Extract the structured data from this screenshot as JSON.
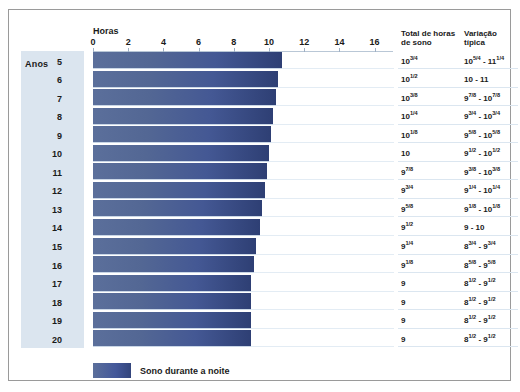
{
  "chart_data": {
    "type": "bar",
    "title": "",
    "xlabel": "Horas",
    "ylabel": "Anos",
    "xlim": [
      0,
      17
    ],
    "grid": true,
    "legend_position": "bottom-left",
    "tick_values": [
      0,
      2,
      4,
      6,
      8,
      10,
      12,
      14,
      16
    ],
    "tick_labels": [
      "0",
      "2",
      "4",
      "6",
      "8",
      "10",
      "12",
      "14",
      "16"
    ],
    "categories": [
      5,
      6,
      7,
      8,
      9,
      10,
      11,
      12,
      13,
      14,
      15,
      16,
      17,
      18,
      19,
      20
    ],
    "category_labels": [
      "5",
      "6",
      "7",
      "8",
      "9",
      "10",
      "11",
      "12",
      "13",
      "14",
      "15",
      "16",
      "17",
      "18",
      "19",
      "20"
    ],
    "values": [
      10.75,
      10.5,
      10.375,
      10.25,
      10.125,
      10,
      9.875,
      9.75,
      9.625,
      9.5,
      9.25,
      9.125,
      9,
      9,
      9,
      9
    ],
    "series": [
      {
        "name": "Sono durante a noite",
        "values": [
          10.75,
          10.5,
          10.375,
          10.25,
          10.125,
          10,
          9.875,
          9.75,
          9.625,
          9.5,
          9.25,
          9.125,
          9,
          9,
          9,
          9
        ]
      }
    ]
  },
  "axis": {
    "title": "Horas",
    "ticks": [
      "0",
      "2",
      "4",
      "6",
      "8",
      "10",
      "12",
      "14",
      "16"
    ]
  },
  "years": {
    "title": "Anos",
    "labels": [
      "5",
      "6",
      "7",
      "8",
      "9",
      "10",
      "11",
      "12",
      "13",
      "14",
      "15",
      "16",
      "17",
      "18",
      "19",
      "20"
    ]
  },
  "columns": {
    "total_header": "Total de horas de sono",
    "variation_header": "Variação típica",
    "total_header_line1": "Total de horas",
    "total_header_line2": "de sono",
    "variation_header_line1": "Variação",
    "variation_header_line2": "típica"
  },
  "rows": [
    {
      "year": "5",
      "total": "10",
      "total_frac": "3/4",
      "variation_from": "10",
      "variation_from_frac": "5/4",
      "variation_to": "11",
      "variation_to_frac": "1/4"
    },
    {
      "year": "6",
      "total": "10",
      "total_frac": "1/2",
      "variation_from": "10",
      "variation_from_frac": "",
      "variation_to": "11",
      "variation_to_frac": ""
    },
    {
      "year": "7",
      "total": "10",
      "total_frac": "3/8",
      "variation_from": "9",
      "variation_from_frac": "7/8",
      "variation_to": "10",
      "variation_to_frac": "7/8"
    },
    {
      "year": "8",
      "total": "10",
      "total_frac": "1/4",
      "variation_from": "9",
      "variation_from_frac": "3/4",
      "variation_to": "10",
      "variation_to_frac": "3/4"
    },
    {
      "year": "9",
      "total": "10",
      "total_frac": "1/8",
      "variation_from": "9",
      "variation_from_frac": "5/8",
      "variation_to": "10",
      "variation_to_frac": "5/8"
    },
    {
      "year": "10",
      "total": "10",
      "total_frac": "",
      "variation_from": "9",
      "variation_from_frac": "1/2",
      "variation_to": "10",
      "variation_to_frac": "1/2"
    },
    {
      "year": "11",
      "total": "9",
      "total_frac": "7/8",
      "variation_from": "9",
      "variation_from_frac": "3/8",
      "variation_to": "10",
      "variation_to_frac": "3/8"
    },
    {
      "year": "12",
      "total": "9",
      "total_frac": "3/4",
      "variation_from": "9",
      "variation_from_frac": "1/4",
      "variation_to": "10",
      "variation_to_frac": "1/4"
    },
    {
      "year": "13",
      "total": "9",
      "total_frac": "5/8",
      "variation_from": "9",
      "variation_from_frac": "1/8",
      "variation_to": "10",
      "variation_to_frac": "1/8"
    },
    {
      "year": "14",
      "total": "9",
      "total_frac": "1/2",
      "variation_from": "9",
      "variation_from_frac": "",
      "variation_to": "10",
      "variation_to_frac": ""
    },
    {
      "year": "15",
      "total": "9",
      "total_frac": "1/4",
      "variation_from": "8",
      "variation_from_frac": "3/4",
      "variation_to": "9",
      "variation_to_frac": "3/4"
    },
    {
      "year": "16",
      "total": "9",
      "total_frac": "1/8",
      "variation_from": "8",
      "variation_from_frac": "5/8",
      "variation_to": "9",
      "variation_to_frac": "5/8"
    },
    {
      "year": "17",
      "total": "9",
      "total_frac": "",
      "variation_from": "8",
      "variation_from_frac": "1/2",
      "variation_to": "9",
      "variation_to_frac": "1/2"
    },
    {
      "year": "18",
      "total": "9",
      "total_frac": "",
      "variation_from": "8",
      "variation_from_frac": "1/2",
      "variation_to": "9",
      "variation_to_frac": "1/2"
    },
    {
      "year": "19",
      "total": "9",
      "total_frac": "",
      "variation_from": "8",
      "variation_from_frac": "1/2",
      "variation_to": "9",
      "variation_to_frac": "1/2"
    },
    {
      "year": "20",
      "total": "9",
      "total_frac": "",
      "variation_from": "8",
      "variation_from_frac": "1/2",
      "variation_to": "9",
      "variation_to_frac": "1/2"
    }
  ],
  "legend": {
    "label": "Sono durante a noite",
    "color": "#44589a"
  },
  "colors": {
    "bar_light": "#5b6f9b",
    "bar_dark": "#2e3f74",
    "years_panel": "#dbe5ef",
    "grid": "#e3ecf4",
    "frame": "#9a9a9a"
  }
}
